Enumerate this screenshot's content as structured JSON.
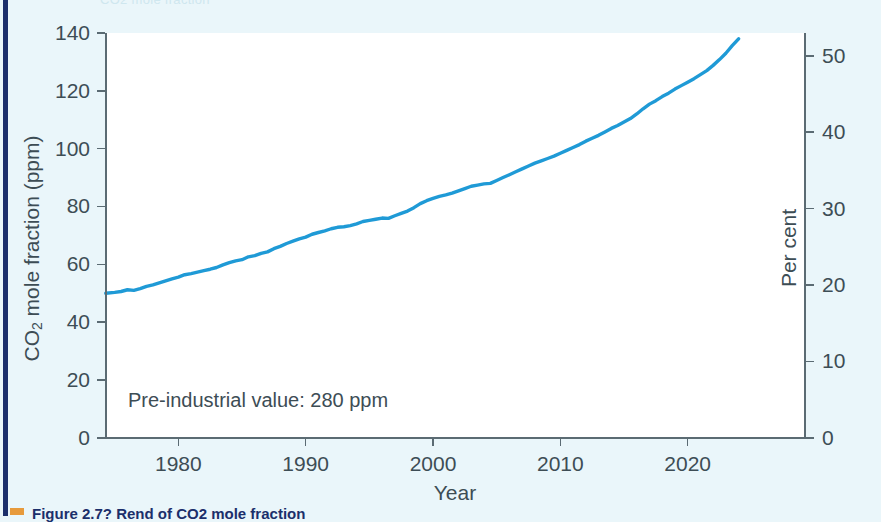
{
  "figure": {
    "annotation": "Pre-industrial value: 280 ppm",
    "caption": "Figure 2.7? Rend of CO2 mole fraction",
    "accent_line_color": "#1f9ad6",
    "left_rule_color": "#1b2f6b",
    "background_color": "#eaf6fa",
    "plot_background_color": "#ffffff",
    "axis_color": "#5b6b73"
  },
  "chart_data": {
    "type": "line",
    "title": "",
    "xlabel": "Year",
    "ylabel": "CO2 mole fraction (ppm)",
    "y2label": "Per cent",
    "xlim": [
      1974.3,
      2029.2
    ],
    "ylim": [
      0,
      140
    ],
    "y2lim": [
      0,
      53
    ],
    "grid": false,
    "legend": null,
    "xticks": [
      1980,
      1990,
      2000,
      2010,
      2020
    ],
    "xticklabels": [
      "1980",
      "1990",
      "2000",
      "2010",
      "2020"
    ],
    "yticks": [
      0,
      20,
      40,
      60,
      80,
      100,
      120,
      140
    ],
    "yticklabels": [
      "0",
      "20",
      "40",
      "60",
      "80",
      "100",
      "120",
      "140"
    ],
    "y2ticks": [
      0,
      10,
      20,
      30,
      40,
      50
    ],
    "y2ticklabels": [
      "0",
      "10",
      "20",
      "30",
      "40",
      "50"
    ],
    "annotations": [
      "Pre-industrial value: 280 ppm"
    ],
    "series": [
      {
        "name": "CO2 mole fraction increase above pre-industrial",
        "color": "#1f9ad6",
        "x": [
          1974.3,
          1975.0,
          1975.5,
          1976.0,
          1976.5,
          1977.0,
          1977.5,
          1978.0,
          1978.5,
          1979.0,
          1979.5,
          1980.0,
          1980.5,
          1981.0,
          1981.5,
          1982.0,
          1982.5,
          1983.0,
          1983.5,
          1984.0,
          1984.5,
          1985.0,
          1985.5,
          1986.0,
          1986.5,
          1987.0,
          1987.5,
          1988.0,
          1988.5,
          1989.0,
          1989.5,
          1990.0,
          1990.5,
          1991.0,
          1991.5,
          1992.0,
          1992.5,
          1993.0,
          1993.5,
          1994.0,
          1994.5,
          1995.0,
          1995.5,
          1996.0,
          1996.5,
          1997.0,
          1997.5,
          1998.0,
          1998.5,
          1999.0,
          1999.5,
          2000.0,
          2000.5,
          2001.0,
          2001.5,
          2002.0,
          2002.5,
          2003.0,
          2003.5,
          2004.0,
          2004.5,
          2005.0,
          2005.5,
          2006.0,
          2006.5,
          2007.0,
          2007.5,
          2008.0,
          2008.5,
          2009.0,
          2009.5,
          2010.0,
          2010.5,
          2011.0,
          2011.5,
          2012.0,
          2012.5,
          2013.0,
          2013.5,
          2014.0,
          2014.5,
          2015.0,
          2015.5,
          2016.0,
          2016.5,
          2017.0,
          2017.5,
          2018.0,
          2018.5,
          2019.0,
          2019.5,
          2020.0,
          2020.5,
          2021.0,
          2021.5,
          2022.0,
          2022.5,
          2023.0,
          2023.5,
          2024.0
        ],
        "y": [
          50.0,
          50.3,
          50.6,
          51.2,
          51.0,
          51.6,
          52.4,
          52.9,
          53.6,
          54.3,
          55.0,
          55.6,
          56.4,
          56.8,
          57.3,
          57.8,
          58.3,
          58.9,
          59.8,
          60.6,
          61.2,
          61.6,
          62.6,
          63.0,
          63.8,
          64.3,
          65.4,
          66.2,
          67.2,
          68.0,
          68.8,
          69.4,
          70.4,
          71.0,
          71.6,
          72.3,
          72.8,
          73.0,
          73.4,
          74.0,
          74.8,
          75.2,
          75.6,
          76.0,
          75.9,
          76.8,
          77.6,
          78.4,
          79.6,
          81.0,
          82.0,
          82.8,
          83.5,
          84.0,
          84.6,
          85.4,
          86.2,
          87.0,
          87.4,
          87.8,
          88.0,
          89.0,
          90.0,
          91.0,
          92.0,
          93.0,
          94.0,
          95.0,
          95.8,
          96.6,
          97.4,
          98.4,
          99.4,
          100.4,
          101.4,
          102.6,
          103.6,
          104.6,
          105.8,
          107.0,
          108.0,
          109.2,
          110.4,
          112.0,
          113.8,
          115.4,
          116.6,
          118.0,
          119.2,
          120.6,
          121.8,
          123.0,
          124.2,
          125.6,
          127.0,
          128.8,
          130.8,
          133.0,
          135.6,
          138.0
        ]
      }
    ]
  },
  "axis_titles": {
    "y_prefix": "CO",
    "y_sub": "2",
    "y_rest": " mole fraction (ppm)",
    "y2": "Per cent",
    "x": "Year"
  },
  "top_sliver_text": "CO2 mole fraction"
}
